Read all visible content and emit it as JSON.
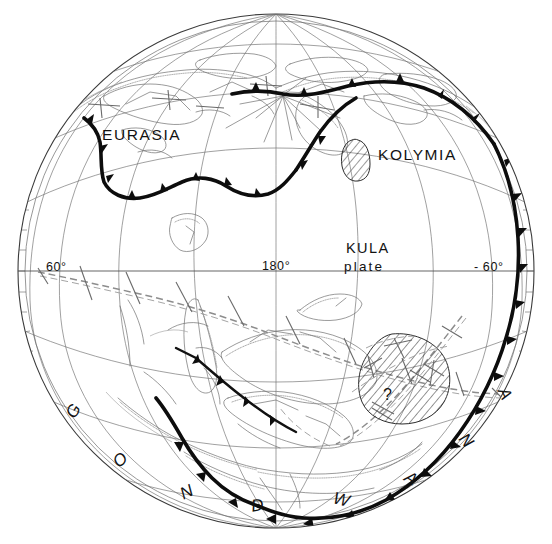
{
  "figure": {
    "name": "paleogeographic-globe-map",
    "projection": "orthographic hemisphere",
    "background_color": "#ffffff",
    "line_color": "#141414"
  },
  "labels": {
    "eurasia": "EURASIA",
    "kolymia": "KOLYMIA",
    "kula_top": "KULA",
    "kula_bottom": "plate",
    "lon_left": "60°",
    "lon_center": "180°",
    "lon_right": "- 60°",
    "query_mark": "?"
  },
  "gondwana": {
    "full": "GONDWANA",
    "letters": [
      {
        "char": "G",
        "x": 78,
        "y": 414,
        "rot": -58
      },
      {
        "char": "O",
        "x": 124,
        "y": 464,
        "rot": -44
      },
      {
        "char": "N",
        "x": 189,
        "y": 497,
        "rot": -26
      },
      {
        "char": "D",
        "x": 258,
        "y": 511,
        "rot": -8
      },
      {
        "char": "W",
        "x": 340,
        "y": 505,
        "rot": 14
      },
      {
        "char": "A",
        "x": 408,
        "y": 483,
        "rot": 32
      },
      {
        "char": "N",
        "x": 462,
        "y": 444,
        "rot": 50
      },
      {
        "char": "A",
        "x": 500,
        "y": 396,
        "rot": 64
      }
    ]
  },
  "legend_features": {
    "subduction_zone": "thick barbed convergent plate boundary",
    "spreading_ridge": "dashed double line spreading ridge",
    "transform_fault": "short tick transform offsets",
    "hatched_block": "hatched continental block",
    "graticule": "latitude and longitude grid"
  },
  "colors": {
    "subduction": "#0d0d0d",
    "ridge": "#8d8d8d",
    "graticule": "#6e6e6e",
    "coastline": "#707070",
    "hatch": "#2c2c2c"
  }
}
